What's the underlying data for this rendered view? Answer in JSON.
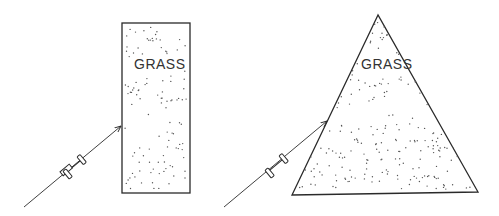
{
  "figure": {
    "panels": [
      {
        "id": "left",
        "shape": "rectangle",
        "label": "GRASS",
        "description": "Car approaching a rectangular grass patch at an angle"
      },
      {
        "id": "right",
        "shape": "triangle",
        "label": "GRASS",
        "description": "Car approaching a triangular grass patch along its slanted edge"
      }
    ],
    "colors": {
      "stroke": "#2a2a2a",
      "dots": "#555555",
      "background": "#ffffff"
    }
  }
}
